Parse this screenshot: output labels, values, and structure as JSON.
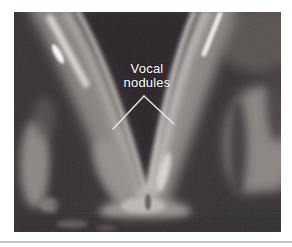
{
  "page": {
    "background_color": "#ffffff",
    "divider_color": "#c3c4c6"
  },
  "figure": {
    "photo_background_color": "#383132",
    "annotation": {
      "label": "Vocal nodules",
      "lines": [
        "Vocal",
        "nodules"
      ],
      "text_color": "#ffffff",
      "pointer_color": "#e9e9e7"
    }
  }
}
